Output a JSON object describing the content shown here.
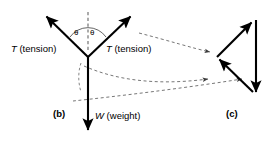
{
  "figure": {
    "stroke_color": "#000000",
    "dash_color": "#555555",
    "background": "#ffffff",
    "panels": [
      {
        "tag": "(b)",
        "name": "free-body-diagram",
        "vertex": [
          88,
          57
        ],
        "vectors": [
          {
            "name": "tension-left",
            "label_symbol": "T",
            "label_text": " (tension)",
            "from": [
              88,
              57
            ],
            "to": [
              44,
              14
            ]
          },
          {
            "name": "tension-right",
            "label_symbol": "T",
            "label_text": " (tension)",
            "from": [
              88,
              57
            ],
            "to": [
              133,
              14
            ]
          },
          {
            "name": "weight",
            "label_symbol": "W",
            "label_text": " (weight)",
            "from": [
              88,
              57
            ],
            "to": [
              88,
              133
            ]
          }
        ],
        "reference_line": {
          "name": "vertical-dashed-reference",
          "from": [
            88,
            50
          ],
          "to": [
            88,
            12
          ],
          "style": "dashed"
        },
        "angles": [
          {
            "name": "theta-left",
            "symbol": "θ"
          },
          {
            "name": "theta-right",
            "symbol": "θ"
          }
        ]
      },
      {
        "tag": "(c)",
        "name": "vector-triangle",
        "points": {
          "apex_top": [
            253,
            20
          ],
          "left": [
            217,
            57
          ],
          "bottom": [
            255,
            95
          ],
          "right_top": [
            256,
            20
          ]
        },
        "vectors": [
          {
            "name": "triangle-tension-up-right",
            "from": [
              217,
              57
            ],
            "to": [
              253,
              20
            ]
          },
          {
            "name": "triangle-tension-up-left",
            "from": [
              253,
              92
            ],
            "to": [
              217,
              57
            ]
          },
          {
            "name": "triangle-weight-down",
            "from": [
              256,
              20
            ],
            "to": [
              255,
              95
            ]
          }
        ]
      }
    ],
    "leaders": [
      {
        "name": "leader-tension-right",
        "from": [
          138,
          33
        ],
        "to": [
          214,
          52
        ]
      },
      {
        "name": "leader-tension-left",
        "from": [
          83,
          62
        ],
        "to": [
          212,
          79
        ]
      },
      {
        "name": "leader-weight",
        "from": [
          72,
          101
        ],
        "to": [
          246,
          79
        ]
      }
    ]
  }
}
